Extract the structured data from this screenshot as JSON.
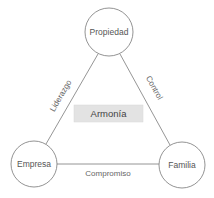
{
  "diagram": {
    "nodes": [
      {
        "id": "propiedad",
        "label": "Propiedad",
        "cx": 109,
        "cy": 32,
        "r": 24
      },
      {
        "id": "empresa",
        "label": "Empresa",
        "cx": 34,
        "cy": 164,
        "r": 23
      },
      {
        "id": "familia",
        "label": "Familia",
        "cx": 182,
        "cy": 165,
        "r": 23
      }
    ],
    "edges": [
      {
        "id": "liderazgo",
        "from": "empresa",
        "to": "propiedad",
        "label": "Liderazgo"
      },
      {
        "id": "control",
        "from": "propiedad",
        "to": "familia",
        "label": "Control"
      },
      {
        "id": "compromiso",
        "from": "empresa",
        "to": "familia",
        "label": "Compromiso"
      }
    ],
    "center": {
      "label": "Armonía",
      "fill": "#e3e3e3"
    },
    "colors": {
      "stroke": "#777777",
      "text": "#555555",
      "background": "#ffffff"
    }
  }
}
